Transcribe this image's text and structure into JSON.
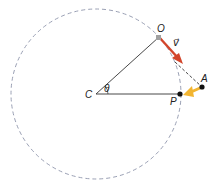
{
  "diagram": {
    "type": "circular-motion-geometry",
    "colors": {
      "circle": "#9aa0b4",
      "lines": "#333333",
      "velocity": "#d2452b",
      "force": "#f2b531",
      "points": "#111111",
      "start_point": "#a0a0a0"
    },
    "labels": {
      "center": "C",
      "angle": "θ",
      "start": "O",
      "velocity": "v⃗",
      "tangent_point": "A",
      "circle_point": "P"
    }
  }
}
